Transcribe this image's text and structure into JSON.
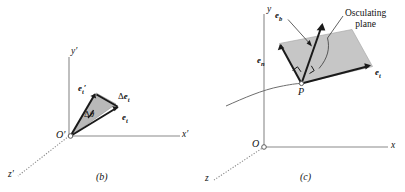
{
  "figure": {
    "background_color": "#ffffff",
    "ink_color": "#111111",
    "axis_color": "#8a8a8a",
    "shade_color": "#c6c6c6",
    "wedge_color": "#b9b9b9"
  },
  "panel_b": {
    "caption": "(b)",
    "origin_label": "O′",
    "axes": [
      {
        "name": "x-axis",
        "label": "x′"
      },
      {
        "name": "y-axis",
        "label": "y′"
      },
      {
        "name": "z-axis",
        "label": "z′"
      }
    ],
    "vectors": [
      {
        "name": "e-t-prime",
        "base": "e",
        "sub": "t",
        "prime": true
      },
      {
        "name": "e-t",
        "base": "e",
        "sub": "t",
        "prime": false
      }
    ],
    "annotations": [
      {
        "name": "delta-e-t",
        "delta": "Δ",
        "base": "e",
        "sub": "t"
      },
      {
        "name": "delta-theta",
        "delta": "Δ",
        "symbol": "θ"
      }
    ]
  },
  "panel_c": {
    "caption": "(c)",
    "origin_label": "O",
    "point_label": "P",
    "axes": [
      {
        "name": "x-axis",
        "label": "x"
      },
      {
        "name": "y-axis",
        "label": "y"
      },
      {
        "name": "z-axis",
        "label": "z"
      }
    ],
    "vectors": [
      {
        "name": "e-b",
        "base": "e",
        "sub": "b"
      },
      {
        "name": "e-n",
        "base": "e",
        "sub": "n"
      },
      {
        "name": "e-t",
        "base": "e",
        "sub": "t"
      }
    ],
    "callout": {
      "name": "osculating-plane-callout",
      "line1": "Osculating",
      "line2": "plane"
    }
  }
}
